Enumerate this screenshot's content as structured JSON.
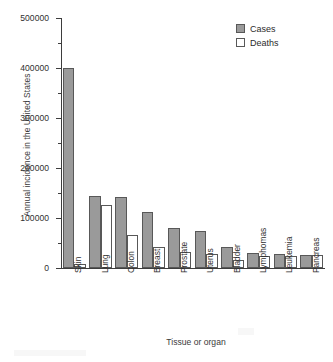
{
  "chart_data": {
    "type": "bar",
    "title": "",
    "xlabel": "Tissue or organ",
    "ylabel": "Annual incidence in the United States",
    "ylim": [
      0,
      500000
    ],
    "ytick_step": 100000,
    "yminor_step": 50000,
    "grid": false,
    "legend_position": "top-right",
    "ytick_labels": [
      "0",
      "100000",
      "200000",
      "300000",
      "400000",
      "500000"
    ],
    "ytick_values": [
      0,
      100000,
      200000,
      300000,
      400000,
      500000
    ],
    "categories": [
      "Skin",
      "Lung",
      "Colon",
      "Breast",
      "Prostate",
      "Uterus",
      "Bladder",
      "Lymphomas",
      "Leukemia",
      "Pancreas"
    ],
    "series": [
      {
        "name": "Cases",
        "color": "#9a9a9a",
        "values": [
          400000,
          145000,
          142000,
          113000,
          80000,
          75000,
          42000,
          31000,
          28000,
          27000
        ]
      },
      {
        "name": "Deaths",
        "color": "#ffffff",
        "values": [
          9000,
          126000,
          67000,
          43000,
          33000,
          29000,
          17000,
          25000,
          25000,
          27000
        ]
      }
    ]
  },
  "legend": {
    "entries": [
      {
        "label": "Cases",
        "swatch": "filled-gray-square"
      },
      {
        "label": "Deaths",
        "swatch": "open-white-square"
      }
    ]
  }
}
